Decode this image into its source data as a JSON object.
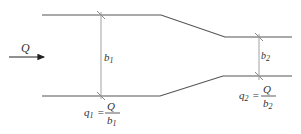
{
  "diagram": {
    "type": "channel-contraction",
    "flow_label": "Q",
    "wide_section": {
      "width_label": "b",
      "width_sub": "1",
      "formula": {
        "lhs": "q",
        "lhs_sub": "1",
        "equals": "=",
        "numerator": "Q",
        "denominator": "b",
        "denominator_sub": "1"
      }
    },
    "narrow_section": {
      "width_label": "b",
      "width_sub": "2",
      "formula": {
        "lhs": "q",
        "lhs_sub": "2",
        "equals": "=",
        "numerator": "Q",
        "denominator": "b",
        "denominator_sub": "2"
      }
    },
    "colors": {
      "wall": "#555555",
      "dimension": "#aaaaaa",
      "arrow": "#222222",
      "text": "#333333"
    }
  }
}
